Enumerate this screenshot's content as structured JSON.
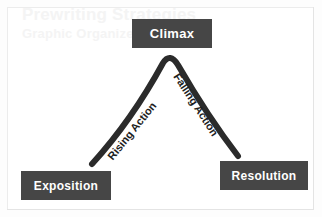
{
  "document": {
    "watermark_title": "Prewriting Strategies",
    "watermark_subtitle": "Graphic Organizers"
  },
  "diagram": {
    "type": "plot-diagram",
    "stages": [
      {
        "id": "climax",
        "label": "Climax"
      },
      {
        "id": "exposition",
        "label": "Exposition"
      },
      {
        "id": "resolution",
        "label": "Resolution"
      }
    ],
    "arc_labels": [
      {
        "id": "rising-action",
        "label": "Rising Action"
      },
      {
        "id": "falling-action",
        "label": "Falling Action"
      }
    ]
  },
  "colors": {
    "box_fill": "#464646",
    "box_text": "#ffffff",
    "arc_stroke": "#2b2b2b",
    "page_background": "#ffffff",
    "watermark_text": "#f4f4f4"
  }
}
